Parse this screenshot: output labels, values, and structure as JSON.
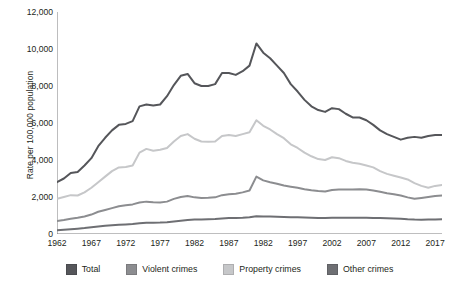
{
  "chart_data": {
    "type": "line",
    "title": "",
    "xlabel": "",
    "ylabel": "Rate per 100,000 population",
    "xlim": [
      1962,
      2018
    ],
    "ylim": [
      0,
      12000
    ],
    "grid": false,
    "legend_position": "bottom",
    "ytick_labels": [
      "0",
      "2,000",
      "4,000",
      "6,000",
      "8,000",
      "10,000",
      "12,000"
    ],
    "ytick_values": [
      0,
      2000,
      4000,
      6000,
      8000,
      10000,
      12000
    ],
    "xtick_labels": [
      "1962",
      "1967",
      "1972",
      "1977",
      "1982",
      "1987",
      "1982",
      "1997",
      "2002",
      "2007",
      "2012",
      "2017"
    ],
    "xtick_values": [
      1962,
      1967,
      1972,
      1977,
      1982,
      1987,
      1992,
      1997,
      2002,
      2007,
      2012,
      2017
    ],
    "minor_tick_interval": 1,
    "x": [
      1962,
      1963,
      1964,
      1965,
      1966,
      1967,
      1968,
      1969,
      1970,
      1971,
      1972,
      1973,
      1974,
      1975,
      1976,
      1977,
      1978,
      1979,
      1980,
      1981,
      1982,
      1983,
      1984,
      1985,
      1986,
      1987,
      1988,
      1989,
      1990,
      1991,
      1992,
      1993,
      1994,
      1995,
      1996,
      1997,
      1998,
      1999,
      2000,
      2001,
      2002,
      2003,
      2004,
      2005,
      2006,
      2007,
      2008,
      2009,
      2010,
      2011,
      2012,
      2013,
      2014,
      2015,
      2016,
      2017,
      2018
    ],
    "series": [
      {
        "name": "Total",
        "color": "#55565a",
        "values": [
          2800,
          3000,
          3300,
          3350,
          3700,
          4100,
          4750,
          5200,
          5600,
          5900,
          5950,
          6100,
          6900,
          7000,
          6950,
          7000,
          7450,
          8050,
          8550,
          8650,
          8150,
          8000,
          8000,
          8100,
          8700,
          8700,
          8600,
          8800,
          9100,
          10300,
          9800,
          9500,
          9100,
          8700,
          8100,
          7700,
          7250,
          6900,
          6700,
          6600,
          6800,
          6750,
          6500,
          6300,
          6300,
          6150,
          5900,
          5600,
          5400,
          5250,
          5100,
          5200,
          5250,
          5200,
          5300,
          5350,
          5350
        ]
      },
      {
        "name": "Violent crimes",
        "color": "#8c8d90",
        "values": [
          700,
          760,
          830,
          880,
          950,
          1050,
          1200,
          1300,
          1400,
          1500,
          1550,
          1600,
          1700,
          1750,
          1720,
          1700,
          1750,
          1900,
          2000,
          2050,
          1980,
          1950,
          1960,
          1980,
          2100,
          2150,
          2180,
          2250,
          2350,
          3100,
          2900,
          2800,
          2720,
          2620,
          2560,
          2500,
          2420,
          2360,
          2320,
          2300,
          2380,
          2400,
          2400,
          2400,
          2420,
          2400,
          2350,
          2280,
          2200,
          2150,
          2080,
          1980,
          1900,
          1950,
          2000,
          2050,
          2080
        ]
      },
      {
        "name": "Property crimes",
        "color": "#c6c7c9",
        "values": [
          1900,
          2000,
          2100,
          2080,
          2250,
          2500,
          2800,
          3100,
          3400,
          3600,
          3620,
          3700,
          4400,
          4600,
          4500,
          4550,
          4650,
          5000,
          5300,
          5400,
          5150,
          5000,
          4980,
          5000,
          5300,
          5350,
          5300,
          5400,
          5500,
          6150,
          5850,
          5650,
          5400,
          5180,
          4850,
          4650,
          4400,
          4200,
          4050,
          4000,
          4150,
          4100,
          3950,
          3850,
          3800,
          3700,
          3600,
          3400,
          3250,
          3150,
          3050,
          2950,
          2750,
          2600,
          2500,
          2600,
          2650
        ]
      },
      {
        "name": "Other crimes",
        "color": "#6e6f73",
        "values": [
          200,
          230,
          260,
          290,
          320,
          360,
          400,
          440,
          470,
          500,
          520,
          540,
          580,
          610,
          610,
          620,
          640,
          680,
          720,
          760,
          780,
          790,
          800,
          810,
          840,
          860,
          870,
          880,
          900,
          960,
          950,
          940,
          930,
          920,
          910,
          900,
          890,
          880,
          870,
          870,
          880,
          880,
          880,
          880,
          880,
          880,
          870,
          860,
          850,
          840,
          830,
          800,
          780,
          770,
          780,
          790,
          800
        ]
      }
    ]
  },
  "legend": {
    "items": [
      {
        "label": "Total",
        "color": "#55565a"
      },
      {
        "label": "Violent crimes",
        "color": "#8c8d90"
      },
      {
        "label": "Property crimes",
        "color": "#c6c7c9"
      },
      {
        "label": "Other crimes",
        "color": "#6e6f73"
      }
    ]
  }
}
